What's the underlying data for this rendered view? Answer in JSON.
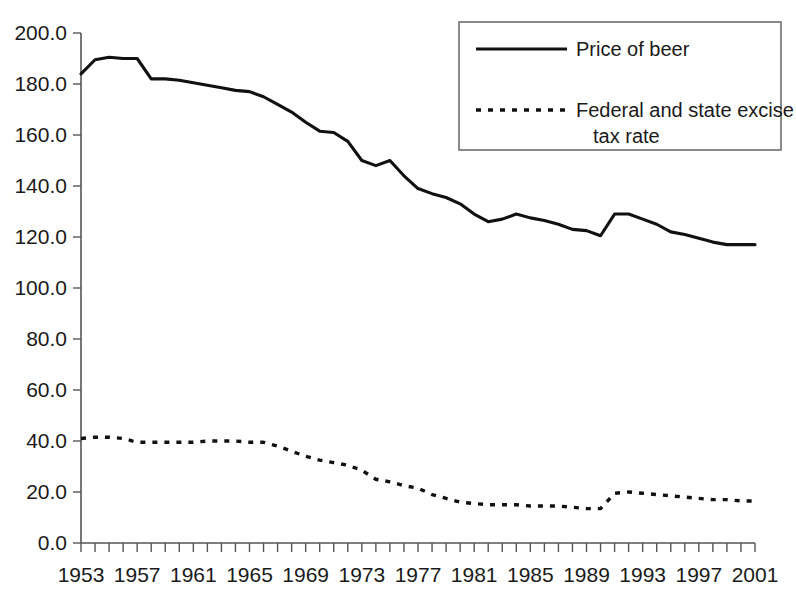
{
  "chart_data": {
    "type": "line",
    "title": "",
    "xlabel": "",
    "ylabel": "",
    "xlim": [
      1953,
      2001
    ],
    "ylim": [
      0.0,
      200.0
    ],
    "grid": false,
    "legend_position": "top-right",
    "y_ticks": [
      "0.0",
      "20.0",
      "40.0",
      "60.0",
      "80.0",
      "100.0",
      "120.0",
      "140.0",
      "160.0",
      "180.0",
      "200.0"
    ],
    "x_ticks": [
      "1953",
      "1957",
      "1961",
      "1965",
      "1969",
      "1973",
      "1977",
      "1981",
      "1985",
      "1989",
      "1993",
      "1997",
      "2001"
    ],
    "x_tick_interval_years": 4,
    "x_minor_tick_interval_years": 1,
    "x": [
      1953,
      1954,
      1955,
      1956,
      1957,
      1958,
      1959,
      1960,
      1961,
      1962,
      1963,
      1964,
      1965,
      1966,
      1967,
      1968,
      1969,
      1970,
      1971,
      1972,
      1973,
      1974,
      1975,
      1976,
      1977,
      1978,
      1979,
      1980,
      1981,
      1982,
      1983,
      1984,
      1985,
      1986,
      1987,
      1988,
      1989,
      1990,
      1991,
      1992,
      1993,
      1994,
      1995,
      1996,
      1997,
      1998,
      1999,
      2000,
      2001
    ],
    "series": [
      {
        "name": "Price of beer",
        "style": "solid",
        "values": [
          184.0,
          189.5,
          190.5,
          190.0,
          190.0,
          182.0,
          182.0,
          181.5,
          180.5,
          179.5,
          178.5,
          177.5,
          177.0,
          175.0,
          172.0,
          169.0,
          165.0,
          161.5,
          161.0,
          157.5,
          150.0,
          148.0,
          150.0,
          144.0,
          139.0,
          137.0,
          135.5,
          133.0,
          129.0,
          126.0,
          127.0,
          129.0,
          127.5,
          126.5,
          125.0,
          123.0,
          122.5,
          120.5,
          129.0,
          129.0,
          127.0,
          125.0,
          122.0,
          121.0,
          119.5,
          118.0,
          117.0,
          117.0,
          117.0
        ]
      },
      {
        "name": "Federal and state excise tax rate",
        "style": "dashed",
        "values": [
          41.0,
          41.5,
          41.5,
          41.0,
          39.5,
          39.5,
          39.5,
          39.5,
          39.5,
          40.0,
          40.0,
          40.0,
          39.5,
          39.5,
          38.0,
          36.0,
          34.0,
          32.5,
          31.5,
          30.5,
          28.5,
          25.0,
          24.0,
          22.5,
          21.5,
          19.0,
          17.5,
          16.0,
          15.5,
          15.0,
          15.0,
          15.0,
          14.5,
          14.5,
          14.5,
          14.0,
          13.5,
          13.5,
          19.5,
          20.0,
          19.5,
          19.0,
          18.5,
          18.0,
          17.5,
          17.0,
          17.0,
          16.5,
          16.5
        ]
      }
    ],
    "annotations": []
  },
  "legend": {
    "entries": [
      {
        "label": "Price of beer",
        "style": "solid"
      },
      {
        "label": "Federal and state excise",
        "label_line2": "tax rate",
        "style": "dashed"
      }
    ]
  },
  "colors": {
    "series_line": "#111111",
    "axis": "#555555",
    "background": "#ffffff",
    "text": "#1a1a1a"
  }
}
